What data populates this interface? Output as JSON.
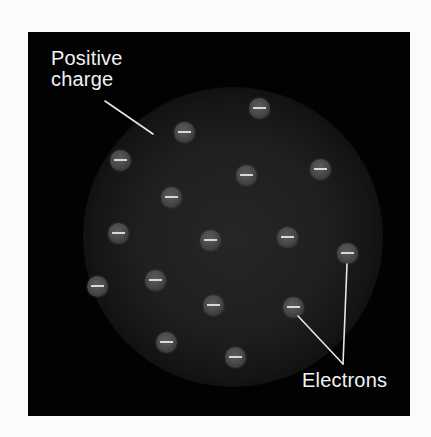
{
  "diagram": {
    "background_color": "#020202",
    "labels": {
      "positive_charge_line1": "Positive",
      "positive_charge_line2": "charge",
      "electrons": "Electrons"
    },
    "electron_symbol": "−",
    "electrons": [
      {
        "x": 259,
        "y": 108
      },
      {
        "x": 184,
        "y": 132
      },
      {
        "x": 120,
        "y": 160
      },
      {
        "x": 246,
        "y": 175
      },
      {
        "x": 320,
        "y": 169
      },
      {
        "x": 171,
        "y": 197
      },
      {
        "x": 118,
        "y": 233
      },
      {
        "x": 210,
        "y": 240
      },
      {
        "x": 287,
        "y": 237
      },
      {
        "x": 347,
        "y": 253
      },
      {
        "x": 97,
        "y": 286
      },
      {
        "x": 155,
        "y": 280
      },
      {
        "x": 213,
        "y": 305
      },
      {
        "x": 293,
        "y": 307
      },
      {
        "x": 166,
        "y": 342
      },
      {
        "x": 235,
        "y": 357
      }
    ],
    "leader_lines": [
      {
        "name": "positive-charge-pointer",
        "x1": 105,
        "y1": 101,
        "x2": 153,
        "y2": 134
      },
      {
        "name": "electron-pointer-1",
        "x1": 347,
        "y1": 264,
        "x2": 343,
        "y2": 364
      },
      {
        "name": "electron-pointer-2",
        "x1": 298,
        "y1": 316,
        "x2": 343,
        "y2": 364
      }
    ]
  }
}
